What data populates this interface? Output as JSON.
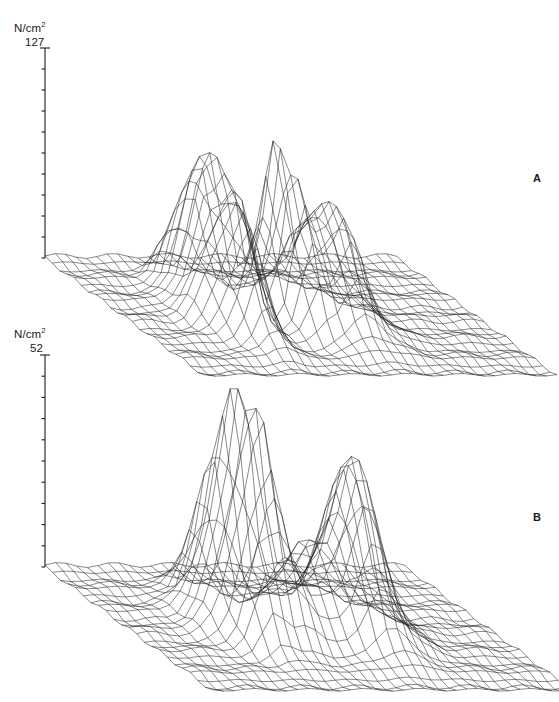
{
  "figure": {
    "type": "scientific-figure",
    "background": "#ffffff",
    "line_color": "#1c1c1c"
  },
  "panels": [
    {
      "id": "A",
      "letter": "A",
      "axis_unit_main": "N/cm",
      "axis_unit_sup": "2",
      "axis_max_label": "127",
      "axis_max_value": 127,
      "axis_min_value": 0,
      "axis_ticks": 11,
      "surface": {
        "grid_cols": 34,
        "grid_rows": 22,
        "peaks": [
          {
            "cx": 0.315,
            "cy": 0.3,
            "h": 0.58,
            "sx": 0.03,
            "sy": 0.085
          },
          {
            "cx": 0.345,
            "cy": 0.44,
            "h": 0.5,
            "sx": 0.024,
            "sy": 0.075
          },
          {
            "cx": 0.3,
            "cy": 0.56,
            "h": 0.4,
            "sx": 0.026,
            "sy": 0.08
          },
          {
            "cx": 0.268,
            "cy": 0.4,
            "h": 0.33,
            "sx": 0.028,
            "sy": 0.09
          },
          {
            "cx": 0.283,
            "cy": 0.7,
            "h": 0.3,
            "sx": 0.03,
            "sy": 0.09
          },
          {
            "cx": 0.252,
            "cy": 0.26,
            "h": 0.26,
            "sx": 0.026,
            "sy": 0.08
          },
          {
            "cx": 0.238,
            "cy": 0.55,
            "h": 0.22,
            "sx": 0.03,
            "sy": 0.095
          },
          {
            "cx": 0.44,
            "cy": 0.46,
            "h": 0.74,
            "sx": 0.027,
            "sy": 0.075
          },
          {
            "cx": 0.47,
            "cy": 0.58,
            "h": 0.45,
            "sx": 0.026,
            "sy": 0.08
          },
          {
            "cx": 0.56,
            "cy": 0.6,
            "h": 0.56,
            "sx": 0.042,
            "sy": 0.115
          },
          {
            "cx": 0.545,
            "cy": 0.4,
            "h": 0.3,
            "sx": 0.034,
            "sy": 0.09
          },
          {
            "cx": 0.2,
            "cy": 0.48,
            "h": 0.1,
            "sx": 0.03,
            "sy": 0.11
          },
          {
            "cx": 0.655,
            "cy": 0.62,
            "h": 0.07,
            "sx": 0.04,
            "sy": 0.12
          }
        ]
      }
    },
    {
      "id": "B",
      "letter": "B",
      "axis_unit_main": "N/cm",
      "axis_unit_sup": "2",
      "axis_max_label": "52",
      "axis_max_value": 52,
      "axis_min_value": 0,
      "axis_ticks": 11,
      "surface": {
        "grid_cols": 34,
        "grid_rows": 22,
        "peaks": [
          {
            "cx": 0.33,
            "cy": 0.42,
            "h": 0.82,
            "sx": 0.026,
            "sy": 0.08
          },
          {
            "cx": 0.352,
            "cy": 0.54,
            "h": 0.62,
            "sx": 0.026,
            "sy": 0.08
          },
          {
            "cx": 0.3,
            "cy": 0.3,
            "h": 0.42,
            "sx": 0.028,
            "sy": 0.085
          },
          {
            "cx": 0.3,
            "cy": 0.62,
            "h": 0.4,
            "sx": 0.03,
            "sy": 0.09
          },
          {
            "cx": 0.272,
            "cy": 0.47,
            "h": 0.34,
            "sx": 0.03,
            "sy": 0.095
          },
          {
            "cx": 0.39,
            "cy": 0.6,
            "h": 0.3,
            "sx": 0.032,
            "sy": 0.095
          },
          {
            "cx": 0.48,
            "cy": 0.52,
            "h": 0.4,
            "sx": 0.045,
            "sy": 0.11
          },
          {
            "cx": 0.6,
            "cy": 0.58,
            "h": 0.72,
            "sx": 0.045,
            "sy": 0.115
          },
          {
            "cx": 0.62,
            "cy": 0.42,
            "h": 0.38,
            "sx": 0.038,
            "sy": 0.095
          },
          {
            "cx": 0.225,
            "cy": 0.44,
            "h": 0.12,
            "sx": 0.032,
            "sy": 0.11
          },
          {
            "cx": 0.7,
            "cy": 0.6,
            "h": 0.09,
            "sx": 0.045,
            "sy": 0.12
          }
        ]
      }
    }
  ]
}
